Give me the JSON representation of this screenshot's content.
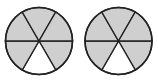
{
  "diagram": {
    "type": "fraction-circles",
    "colors": {
      "shaded": "#cfcfcf",
      "unshaded": "#ffffff",
      "stroke": "#222222"
    },
    "circles": [
      {
        "id": "left",
        "cx": 39,
        "cy": 41,
        "r": 33.5,
        "sectors": 6,
        "shaded": [
          0,
          1,
          2,
          3,
          5
        ],
        "unshaded": [
          4
        ]
      },
      {
        "id": "right",
        "cx": 118.5,
        "cy": 41,
        "r": 33.5,
        "sectors": 6,
        "shaded": [
          0,
          1,
          2,
          3,
          5
        ],
        "unshaded": [
          4
        ]
      }
    ]
  }
}
